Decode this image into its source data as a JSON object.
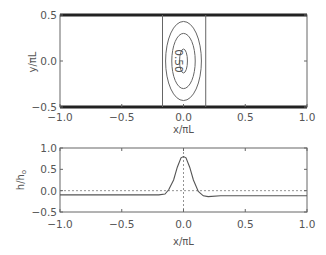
{
  "chart_data": [
    {
      "type": "contour",
      "title": "",
      "xlabel": "x/πL",
      "ylabel": "y/πL",
      "xlim": [
        -1.0,
        1.0
      ],
      "ylim": [
        -0.55,
        0.55
      ],
      "xticks": [
        "−1.0",
        "−0.5",
        "0.0",
        "0.5",
        "1.0"
      ],
      "yticks": [
        "0.5",
        "0.0",
        "−0.5"
      ],
      "walls": [
        0.5,
        -0.5
      ],
      "vertical_lines_x": [
        -0.17,
        0.18
      ],
      "contour_labels": [
        "0.50"
      ],
      "contours": [
        {
          "level": "outer",
          "cx": 0.0,
          "cy": 0.0,
          "rx": 0.145,
          "ry": 0.43
        },
        {
          "level": "0.50",
          "cx": 0.0,
          "cy": 0.0,
          "rx": 0.095,
          "ry": 0.3
        },
        {
          "level": "inner",
          "cx": 0.0,
          "cy": 0.0,
          "rx": 0.032,
          "ry": 0.13
        }
      ],
      "grid": false
    },
    {
      "type": "line",
      "title": "",
      "xlabel": "x/πL",
      "ylabel": "h/h₀",
      "xlim": [
        -1.0,
        1.0
      ],
      "ylim": [
        -0.5,
        1.0
      ],
      "xticks": [
        "−1.0",
        "−0.5",
        "0.0",
        "0.5",
        "1.0"
      ],
      "yticks": [
        "1.0",
        "0.5",
        "0.0",
        "−0.5"
      ],
      "reference_lines": {
        "horizontal_dotted_y": 0.0,
        "vertical_dotted_x": 0.0
      },
      "series": [
        {
          "name": "h/h0",
          "x": [
            -1.0,
            -0.5,
            -0.2,
            -0.15,
            -0.12,
            -0.08,
            -0.05,
            -0.02,
            0.0,
            0.02,
            0.05,
            0.08,
            0.12,
            0.16,
            0.2,
            0.3,
            0.5,
            1.0
          ],
          "y": [
            -0.1,
            -0.1,
            -0.1,
            -0.08,
            0.02,
            0.25,
            0.55,
            0.77,
            0.8,
            0.77,
            0.55,
            0.25,
            -0.02,
            -0.12,
            -0.14,
            -0.12,
            -0.12,
            -0.12
          ]
        }
      ],
      "grid": false
    }
  ]
}
